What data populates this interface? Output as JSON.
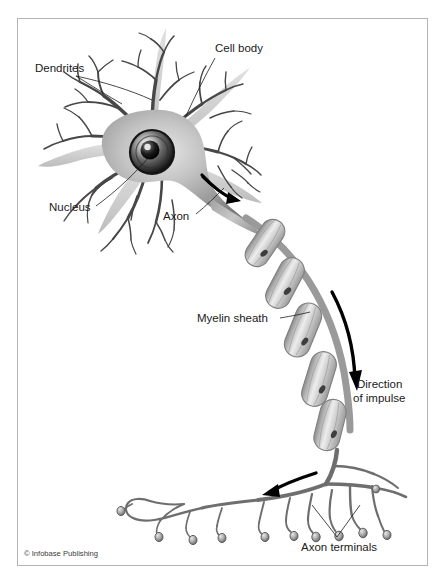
{
  "figure": {
    "credit": "© Infobase Publishing",
    "frame_color": "#b4b4b4",
    "background_color": "#ffffff"
  },
  "labels": {
    "dendrites": "Dendrites",
    "cell_body": "Cell body",
    "nucleus": "Nucleus",
    "axon": "Axon",
    "myelin_sheath": "Myelin sheath",
    "direction_line1": "Direction",
    "direction_line2": "of impulse",
    "axon_terminals": "Axon terminals"
  },
  "colors": {
    "text": "#1a1a1a",
    "dendrite_stroke": "#4a4a4a",
    "soma_light": "#d8d8d8",
    "soma_mid": "#9a9a9a",
    "soma_dark": "#6e6e6e",
    "nucleus_dark": "#111111",
    "myelin_light": "#e2e2e2",
    "myelin_mid": "#b0b0b0",
    "myelin_outline": "#7d7d7d",
    "axon_gray": "#8c8c8c",
    "terminal_stroke": "#6a6a6a",
    "arrow_black": "#000000"
  }
}
